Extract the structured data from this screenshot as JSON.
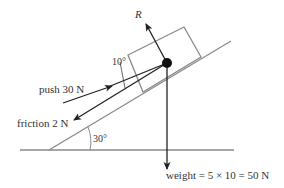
{
  "diagram": {
    "type": "inclined-plane-force-diagram",
    "labels": {
      "normal": "R",
      "angle_push": "10°",
      "push": "push 30 N",
      "friction": "friction 2 N",
      "incline_angle": "30°",
      "weight": "weight = 5 × 10 = 50 N"
    },
    "colors": {
      "lines": "#8a8a8a",
      "arrows": "#222222",
      "text": "#333333",
      "particle": "#111111"
    }
  }
}
